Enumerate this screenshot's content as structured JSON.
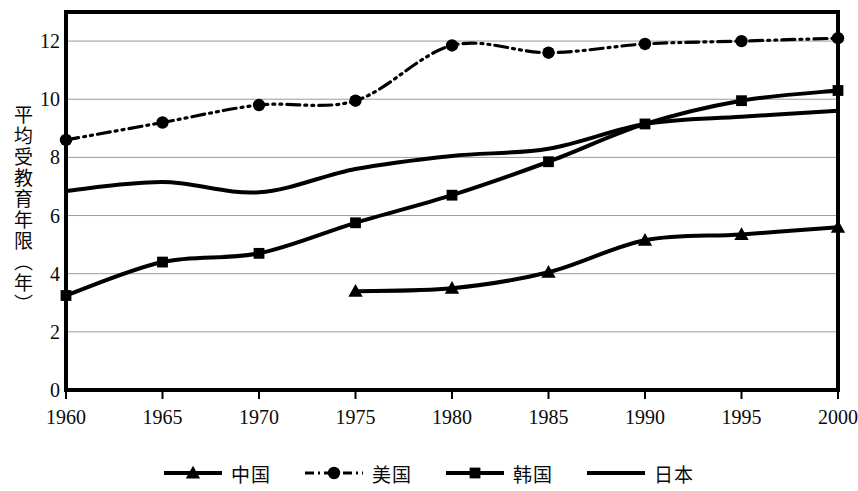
{
  "chart_data": {
    "type": "line",
    "title": "",
    "subtitle": "",
    "xlabel": "",
    "ylabel": "平均受教育年限（年）",
    "x": [
      1960,
      1965,
      1970,
      1975,
      1980,
      1985,
      1990,
      1995,
      2000
    ],
    "xtick_labels": [
      "1960",
      "1965",
      "1970",
      "1975",
      "1980",
      "1985",
      "1990",
      "1995",
      "2000"
    ],
    "ytick_labels": [
      "0",
      "2",
      "4",
      "6",
      "8",
      "10",
      "12"
    ],
    "ytick_values": [
      0,
      2,
      4,
      6,
      8,
      10,
      12
    ],
    "xlim": [
      1960,
      2000
    ],
    "ylim": [
      0,
      13
    ],
    "grid": "horizontal",
    "legend_position": "bottom",
    "series": [
      {
        "name": "中国",
        "marker": "triangle",
        "linestyle": "solid",
        "color": "#000000",
        "x": [
          1975,
          1980,
          1985,
          1990,
          1995,
          2000
        ],
        "values": [
          3.4,
          3.5,
          4.05,
          5.15,
          5.35,
          5.6
        ]
      },
      {
        "name": "美国",
        "marker": "circle",
        "linestyle": "dashdot",
        "color": "#000000",
        "x": [
          1960,
          1965,
          1970,
          1975,
          1980,
          1985,
          1990,
          1995,
          2000
        ],
        "values": [
          8.6,
          9.2,
          9.8,
          9.95,
          11.85,
          11.6,
          11.9,
          12.0,
          12.1
        ]
      },
      {
        "name": "韩国",
        "marker": "square",
        "linestyle": "solid",
        "color": "#000000",
        "x": [
          1960,
          1965,
          1970,
          1975,
          1980,
          1985,
          1990,
          1995,
          2000
        ],
        "values": [
          3.25,
          4.4,
          4.7,
          5.75,
          6.7,
          7.85,
          9.15,
          9.95,
          10.3
        ]
      },
      {
        "name": "日本",
        "marker": "none",
        "linestyle": "solid",
        "color": "#000000",
        "x": [
          1960,
          1965,
          1970,
          1975,
          1980,
          1985,
          1990,
          1995,
          2000
        ],
        "values": [
          6.85,
          7.15,
          6.8,
          7.6,
          8.05,
          8.3,
          9.15,
          9.4,
          9.6
        ]
      }
    ]
  },
  "legend": {
    "items": [
      {
        "label": "中国",
        "marker": "triangle-marker",
        "linestyle": "solid"
      },
      {
        "label": "美国",
        "marker": "circle-marker",
        "linestyle": "dashdot"
      },
      {
        "label": "韩国",
        "marker": "square-marker",
        "linestyle": "solid"
      },
      {
        "label": "日本",
        "marker": "none",
        "linestyle": "solid"
      }
    ]
  }
}
